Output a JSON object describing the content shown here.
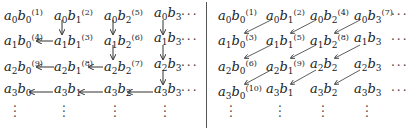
{
  "figure": {
    "left": {
      "title": "column-wise zigzag enumeration",
      "rows": [
        [
          {
            "a": "0",
            "b": "0",
            "n": "(1)"
          },
          {
            "a": "0",
            "b": "1",
            "n": "(2)"
          },
          {
            "a": "0",
            "b": "2",
            "n": "(5)"
          },
          {
            "a": "0",
            "b": "3",
            "n": ""
          }
        ],
        [
          {
            "a": "1",
            "b": "0",
            "n": "(4)"
          },
          {
            "a": "1",
            "b": "1",
            "n": "(3)"
          },
          {
            "a": "1",
            "b": "2",
            "n": "(6)"
          },
          {
            "a": "1",
            "b": "3",
            "n": ""
          }
        ],
        [
          {
            "a": "2",
            "b": "0",
            "n": "(9)"
          },
          {
            "a": "2",
            "b": "1",
            "n": "(8)"
          },
          {
            "a": "2",
            "b": "2",
            "n": "(7)"
          },
          {
            "a": "2",
            "b": "3",
            "n": ""
          }
        ],
        [
          {
            "a": "3",
            "b": "0",
            "n": ""
          },
          {
            "a": "3",
            "b": "1",
            "n": ""
          },
          {
            "a": "3",
            "b": "2",
            "n": ""
          },
          {
            "a": "3",
            "b": "3",
            "n": ""
          }
        ]
      ],
      "hdots": "···",
      "vdots": "⋮"
    },
    "right": {
      "title": "diagonal enumeration",
      "rows": [
        [
          {
            "a": "0",
            "b": "0",
            "n": "(1)"
          },
          {
            "a": "0",
            "b": "1",
            "n": "(2)"
          },
          {
            "a": "0",
            "b": "2",
            "n": "(4)"
          },
          {
            "a": "0",
            "b": "3",
            "n": "(7)"
          }
        ],
        [
          {
            "a": "1",
            "b": "0",
            "n": "(3)"
          },
          {
            "a": "1",
            "b": "1",
            "n": "(5)"
          },
          {
            "a": "1",
            "b": "2",
            "n": "(8)"
          },
          {
            "a": "1",
            "b": "3",
            "n": ""
          }
        ],
        [
          {
            "a": "2",
            "b": "0",
            "n": "(6)"
          },
          {
            "a": "2",
            "b": "1",
            "n": "(9)"
          },
          {
            "a": "2",
            "b": "2",
            "n": ""
          },
          {
            "a": "2",
            "b": "3",
            "n": ""
          }
        ],
        [
          {
            "a": "3",
            "b": "0",
            "n": "(10)"
          },
          {
            "a": "3",
            "b": "1",
            "n": ""
          },
          {
            "a": "3",
            "b": "2",
            "n": ""
          },
          {
            "a": "3",
            "b": "3",
            "n": ""
          }
        ]
      ],
      "hdots": "···",
      "vdots": "⋮"
    },
    "colors": {
      "text": "#222222",
      "arrow": "#333333",
      "divider": "#555555"
    }
  }
}
